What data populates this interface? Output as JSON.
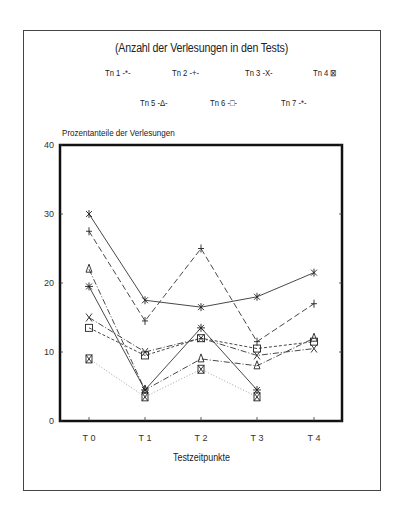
{
  "chart_data": {
    "type": "line",
    "title": "(Anzahl der Verlesungen in den Tests)",
    "xlabel": "Testzeitpunkte",
    "ylabel": "Prozentanteile der Verlesungen",
    "categories": [
      "T 0",
      "T 1",
      "T 2",
      "T 3",
      "T 4"
    ],
    "ylim": [
      0,
      40
    ],
    "yticks": [
      0,
      10,
      20,
      30,
      40
    ],
    "grid": false,
    "legend_position": "top",
    "series": [
      {
        "name": "Tn 1",
        "marker": "asterisk",
        "line": "solid",
        "values": [
          30,
          17.5,
          16.5,
          18,
          21.5
        ]
      },
      {
        "name": "Tn 2",
        "marker": "plus",
        "line": "longdash",
        "values": [
          27.5,
          14.5,
          25,
          11.5,
          17
        ]
      },
      {
        "name": "Tn 3",
        "marker": "x",
        "line": "dashdot",
        "values": [
          15,
          10,
          12,
          9.5,
          10.5
        ]
      },
      {
        "name": "Tn 4",
        "marker": "boxed-x",
        "line": "dotted",
        "values": [
          9,
          3.5,
          7.5,
          3.5,
          null
        ]
      },
      {
        "name": "Tn 5",
        "marker": "triangle",
        "line": "dashdot",
        "values": [
          22,
          4.5,
          9,
          8,
          12
        ]
      },
      {
        "name": "Tn 6",
        "marker": "square",
        "line": "dashed",
        "values": [
          13.5,
          9.5,
          12,
          10.5,
          11.5
        ]
      },
      {
        "name": "Tn 7",
        "marker": "asterisk-plus",
        "line": "solid",
        "values": [
          19.5,
          4.5,
          13.5,
          4.5,
          null
        ]
      }
    ]
  },
  "legend": {
    "items": [
      {
        "label": "Tn 1",
        "glyph": "-*-"
      },
      {
        "label": "Tn 2",
        "glyph": "-+-"
      },
      {
        "label": "Tn 3",
        "glyph": "-X-"
      },
      {
        "label": "Tn 4",
        "glyph": "⊠"
      },
      {
        "label": "Tn 5",
        "glyph": "-Δ-"
      },
      {
        "label": "Tn 6",
        "glyph": "-□-"
      },
      {
        "label": "Tn 7",
        "glyph": "-*-"
      }
    ]
  }
}
